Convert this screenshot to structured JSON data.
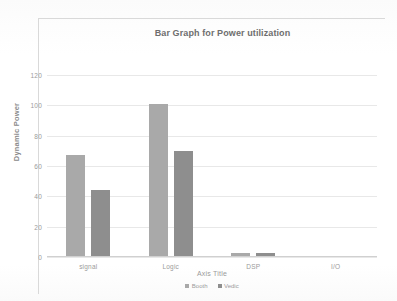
{
  "chart_data": {
    "type": "bar",
    "title": "Bar Graph for Power utilization",
    "xlabel": "Axis Title",
    "ylabel": "Dynamic Power",
    "categories": [
      "signal",
      "Logic",
      "DSP",
      "I/O"
    ],
    "series": [
      {
        "name": "Booth",
        "color": "#a9a9a9",
        "values": [
          67,
          101,
          2.5,
          1
        ]
      },
      {
        "name": "Vedic",
        "color": "#8e8e8e",
        "values": [
          44,
          70,
          2.5,
          1
        ]
      }
    ],
    "ylim": [
      0,
      130
    ],
    "yticks": [
      0,
      20,
      40,
      60,
      80,
      100,
      120
    ],
    "ytick_labels": [
      "0",
      "20",
      "40",
      "60",
      "80",
      "100",
      "120"
    ],
    "grid": true,
    "legend_position": "bottom"
  },
  "colors": {
    "booth": "#a9a9a9",
    "vedic": "#8e8e8e",
    "gridline": "#e8e8e8",
    "frame": "#d9d9d9",
    "title_text": "#6e6e6e",
    "tick_text": "#9b9b9b"
  }
}
